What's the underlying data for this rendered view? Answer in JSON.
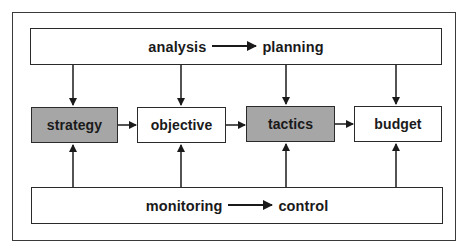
{
  "diagram": {
    "top_box": {
      "from_label": "analysis",
      "to_label": "planning"
    },
    "middle_row": [
      {
        "label": "strategy",
        "shaded": true
      },
      {
        "label": "objective",
        "shaded": false
      },
      {
        "label": "tactics",
        "shaded": true
      },
      {
        "label": "budget",
        "shaded": false
      }
    ],
    "bottom_box": {
      "from_label": "monitoring",
      "to_label": "control"
    },
    "colors": {
      "shaded_fill": "#a6a6a6",
      "line": "#1a1a1a",
      "background": "#ffffff"
    },
    "edges": [
      {
        "from": "analysis-planning",
        "to": "strategy"
      },
      {
        "from": "analysis-planning",
        "to": "objective"
      },
      {
        "from": "analysis-planning",
        "to": "tactics"
      },
      {
        "from": "analysis-planning",
        "to": "budget"
      },
      {
        "from": "strategy",
        "to": "objective"
      },
      {
        "from": "objective",
        "to": "tactics"
      },
      {
        "from": "tactics",
        "to": "budget"
      },
      {
        "from": "monitoring-control",
        "to": "strategy"
      },
      {
        "from": "monitoring-control",
        "to": "objective"
      },
      {
        "from": "monitoring-control",
        "to": "tactics"
      },
      {
        "from": "monitoring-control",
        "to": "budget"
      }
    ]
  }
}
